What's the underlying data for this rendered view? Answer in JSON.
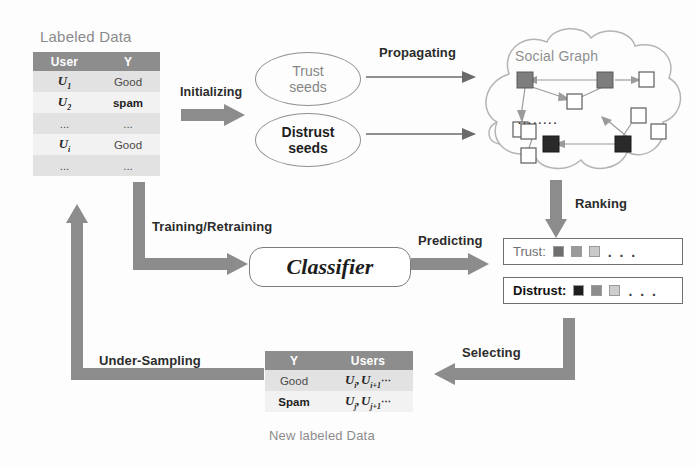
{
  "diagram": {
    "colors": {
      "arrow_gray": "#8c8c8c",
      "header_gray": "#8d8d8d",
      "row_light": "#e2e2e2",
      "row_lighter": "#f2f2f2",
      "cloud_outline": "#b4b4b4",
      "node_gray": "#7d7d7d",
      "node_black": "#2a2a2a",
      "node_white": "#ffffff"
    }
  },
  "labeled_data": {
    "title": "Labeled Data",
    "headers": [
      "User",
      "Y"
    ],
    "rows": [
      {
        "user": "U",
        "sub": "1",
        "y": "Good"
      },
      {
        "user": "U",
        "sub": "2",
        "y": "spam"
      },
      {
        "user": "...",
        "sub": "",
        "y": "..."
      },
      {
        "user": "U",
        "sub": "i",
        "y": "Good"
      },
      {
        "user": "...",
        "sub": "",
        "y": "..."
      }
    ]
  },
  "seeds": {
    "trust": {
      "line1": "Trust",
      "line2": "seeds"
    },
    "distrust": {
      "line1": "Distrust",
      "line2": "seeds"
    }
  },
  "social_graph": {
    "title": "Social Graph",
    "inner_dots": "........"
  },
  "classifier": {
    "label": "Classifier"
  },
  "ranking_lists": {
    "trust": {
      "label": "Trust:",
      "squares": [
        "#6e6e6e",
        "#9a9a9a",
        "#c9c9c9"
      ],
      "ellipsis": ". . ."
    },
    "distrust": {
      "label": "Distrust:",
      "squares": [
        "#1f1f1f",
        "#8c8c8c",
        "#cdcdcd"
      ],
      "ellipsis": ". . ."
    }
  },
  "new_labeled_data": {
    "caption": "New labeled Data",
    "headers": [
      "Y",
      "Users"
    ],
    "rows": [
      {
        "y": "Good",
        "users_a": "U",
        "sub_a": "i",
        "users_b": "U",
        "sub_b": "i+1",
        "tail": "⋯"
      },
      {
        "y": "Spam",
        "users_a": "U",
        "sub_a": "j",
        "users_b": "U",
        "sub_b": "j+1",
        "tail": "⋯"
      }
    ]
  },
  "arrow_labels": {
    "initializing": "Initializing",
    "propagating": "Propagating",
    "ranking": "Ranking",
    "training": "Training/Retraining",
    "predicting": "Predicting",
    "selecting": "Selecting",
    "under_sampling": "Under-Sampling"
  }
}
